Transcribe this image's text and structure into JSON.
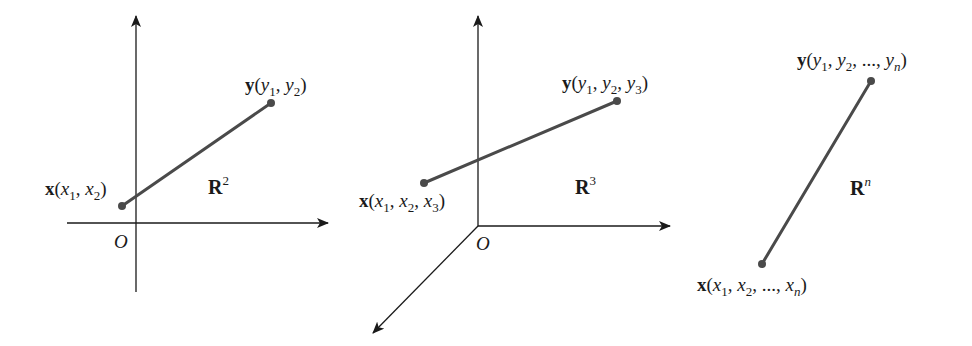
{
  "figure": {
    "colors": {
      "axis": "#1a1a1a",
      "segment": "#4a4a4a",
      "background": "#ffffff"
    },
    "panels": [
      {
        "id": "r2",
        "space": {
          "base": "R",
          "exponent": "2"
        },
        "origin_label": "O",
        "axes": [
          "x-axis",
          "y-axis"
        ],
        "point_x": {
          "name": "x",
          "coords": [
            "x",
            "x"
          ],
          "subscripts": [
            "1",
            "2"
          ],
          "label": "x(x1, x2)"
        },
        "point_y": {
          "name": "y",
          "coords": [
            "y",
            "y"
          ],
          "subscripts": [
            "1",
            "2"
          ],
          "label": "y(y1, y2)"
        }
      },
      {
        "id": "r3",
        "space": {
          "base": "R",
          "exponent": "3"
        },
        "origin_label": "O",
        "axes": [
          "x-axis",
          "y-axis",
          "z-axis"
        ],
        "point_x": {
          "name": "x",
          "subscripts": [
            "1",
            "2",
            "3"
          ],
          "label": "x(x1, x2, x3)"
        },
        "point_y": {
          "name": "y",
          "subscripts": [
            "1",
            "2",
            "3"
          ],
          "label": "y(y1, y2, y3)"
        }
      },
      {
        "id": "rn",
        "space": {
          "base": "R",
          "exponent": "n"
        },
        "point_x": {
          "name": "x",
          "subscripts": [
            "1",
            "2",
            "n"
          ],
          "ellipsis": "...",
          "label": "x(x1, x2, ..., xn)"
        },
        "point_y": {
          "name": "y",
          "subscripts": [
            "1",
            "2",
            "n"
          ],
          "ellipsis": "...",
          "label": "y(y1, y2, ..., yn)"
        }
      }
    ]
  }
}
